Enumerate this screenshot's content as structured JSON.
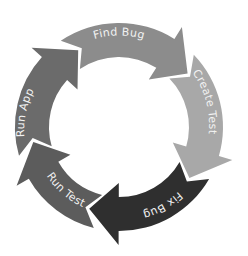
{
  "diagram": {
    "type": "cycle",
    "direction": "clockwise",
    "center": [
      119,
      127
    ],
    "outer_radius": 104,
    "inner_radius": 70,
    "steps": [
      {
        "label": "Find Bug",
        "color": "#8c8c8c",
        "head_color": "#7d7d7d",
        "start_deg": 238,
        "end_deg": 318
      },
      {
        "label": "Create Test",
        "color": "#a8a8a8",
        "head_color": "#a4a4a4",
        "start_deg": 318,
        "end_deg": 392
      },
      {
        "label": "Fix Bug",
        "color": "#2f2f2f",
        "head_color": "#2a2a2a",
        "start_deg": 32,
        "end_deg": 106
      },
      {
        "label": "Run Test",
        "color": "#5c5c5c",
        "head_color": "#555555",
        "start_deg": 106,
        "end_deg": 166
      },
      {
        "label": "Run App",
        "color": "#6b6b6b",
        "head_color": "#666666",
        "start_deg": 166,
        "end_deg": 238
      }
    ]
  }
}
